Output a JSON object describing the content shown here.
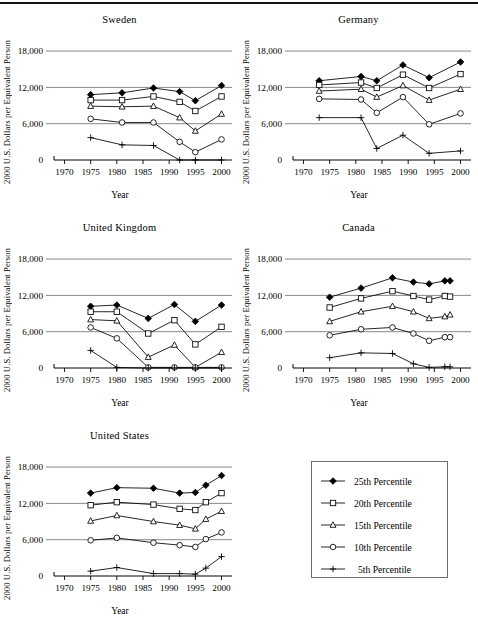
{
  "figure": {
    "axis_label_y": "2000 U.S. Dollars per Equivalent Person",
    "axis_label_x": "Year",
    "y_ticks": [
      "0",
      "6,000",
      "12,000",
      "18,000"
    ],
    "x_ticks": [
      "1970",
      "1975",
      "1980",
      "1985",
      "1990",
      "1995",
      "2000"
    ]
  },
  "legend": {
    "items": [
      {
        "label": "25th Percentile",
        "marker": "filled-diamond"
      },
      {
        "label": "20th Percentile",
        "marker": "open-square"
      },
      {
        "label": "15th Percentile",
        "marker": "open-triangle"
      },
      {
        "label": "10th Percentile",
        "marker": "open-circle"
      },
      {
        "label": "5th Percentile",
        "marker": "plus"
      }
    ]
  },
  "chart_data": [
    {
      "type": "line",
      "title": "Sweden",
      "xlabel": "Year",
      "ylabel": "2000 U.S. Dollars per Equivalent Person",
      "xlim": [
        1968,
        2002
      ],
      "ylim": [
        0,
        19500
      ],
      "yticks": [
        0,
        6000,
        12000,
        18000
      ],
      "xticks": [
        1970,
        1975,
        1980,
        1985,
        1990,
        1995,
        2000
      ],
      "grid": "horizontal",
      "x": [
        1975,
        1981,
        1987,
        1992,
        1995,
        2000
      ],
      "series": [
        {
          "name": "25th Percentile",
          "marker": "filled-diamond",
          "values": [
            10800,
            11100,
            11900,
            11300,
            9800,
            12300
          ]
        },
        {
          "name": "20th Percentile",
          "marker": "open-square",
          "values": [
            9900,
            9900,
            10500,
            9600,
            8100,
            10500
          ]
        },
        {
          "name": "15th Percentile",
          "marker": "open-triangle",
          "values": [
            8900,
            8800,
            8900,
            7000,
            4800,
            7600
          ]
        },
        {
          "name": "10th Percentile",
          "marker": "open-circle",
          "values": [
            6800,
            6200,
            6200,
            3000,
            1300,
            3400
          ]
        },
        {
          "name": "5th Percentile",
          "marker": "plus",
          "values": [
            3700,
            2500,
            2400,
            0,
            0,
            0
          ]
        }
      ]
    },
    {
      "type": "line",
      "title": "Germany",
      "xlabel": "Year",
      "ylabel": "2000 U.S. Dollars per Equivalent Person",
      "xlim": [
        1968,
        2002
      ],
      "ylim": [
        0,
        19500
      ],
      "yticks": [
        0,
        6000,
        12000,
        18000
      ],
      "xticks": [
        1970,
        1975,
        1980,
        1985,
        1990,
        1995,
        2000
      ],
      "grid": "horizontal",
      "x": [
        1973,
        1981,
        1984,
        1989,
        1994,
        2000
      ],
      "series": [
        {
          "name": "25th Percentile",
          "marker": "filled-diamond",
          "values": [
            13100,
            13800,
            13100,
            15700,
            13600,
            16200
          ]
        },
        {
          "name": "20th Percentile",
          "marker": "open-square",
          "values": [
            12400,
            12800,
            11900,
            14100,
            11900,
            14200
          ]
        },
        {
          "name": "15th Percentile",
          "marker": "open-triangle",
          "values": [
            11400,
            11700,
            10400,
            12300,
            9900,
            11700
          ]
        },
        {
          "name": "10th Percentile",
          "marker": "open-circle",
          "values": [
            10100,
            10000,
            7800,
            10400,
            5900,
            7700
          ]
        },
        {
          "name": "5th Percentile",
          "marker": "plus",
          "values": [
            7000,
            7000,
            1900,
            4100,
            1100,
            1500
          ]
        }
      ]
    },
    {
      "type": "line",
      "title": "United Kingdom",
      "xlabel": "Year",
      "ylabel": "2000 U.S. Dollars per Equivalent Person",
      "xlim": [
        1968,
        2002
      ],
      "ylim": [
        0,
        19500
      ],
      "yticks": [
        0,
        6000,
        12000,
        18000
      ],
      "xticks": [
        1970,
        1975,
        1980,
        1985,
        1990,
        1995,
        2000
      ],
      "grid": "horizontal",
      "x": [
        1975,
        1980,
        1986,
        1991,
        1995,
        2000
      ],
      "series": [
        {
          "name": "25th Percentile",
          "marker": "filled-diamond",
          "values": [
            10200,
            10400,
            8200,
            10500,
            7700,
            10400
          ]
        },
        {
          "name": "20th Percentile",
          "marker": "open-square",
          "values": [
            9300,
            9300,
            5700,
            7900,
            3900,
            6800
          ]
        },
        {
          "name": "15th Percentile",
          "marker": "open-triangle",
          "values": [
            8000,
            7800,
            1800,
            3800,
            100,
            2600
          ]
        },
        {
          "name": "10th Percentile",
          "marker": "open-circle",
          "values": [
            6700,
            4900,
            100,
            100,
            100,
            100
          ]
        },
        {
          "name": "5th Percentile",
          "marker": "plus",
          "values": [
            2900,
            100,
            0,
            0,
            0,
            0
          ]
        }
      ]
    },
    {
      "type": "line",
      "title": "Canada",
      "xlabel": "Year",
      "ylabel": "2000 U.S. Dollars per Equivalent Person",
      "xlim": [
        1968,
        2002
      ],
      "ylim": [
        0,
        19500
      ],
      "yticks": [
        0,
        6000,
        12000,
        18000
      ],
      "xticks": [
        1970,
        1975,
        1980,
        1985,
        1990,
        1995,
        2000
      ],
      "grid": "horizontal",
      "x": [
        1975,
        1981,
        1987,
        1991,
        1994,
        1997,
        1998
      ],
      "series": [
        {
          "name": "25th Percentile",
          "marker": "filled-diamond",
          "values": [
            11700,
            13200,
            14900,
            14200,
            13900,
            14400,
            14400
          ]
        },
        {
          "name": "20th Percentile",
          "marker": "open-square",
          "values": [
            10000,
            11500,
            12700,
            11900,
            11300,
            11900,
            11800
          ]
        },
        {
          "name": "15th Percentile",
          "marker": "open-triangle",
          "values": [
            7700,
            9300,
            10200,
            9300,
            8200,
            8500,
            8800
          ]
        },
        {
          "name": "10th Percentile",
          "marker": "open-circle",
          "values": [
            5400,
            6400,
            6700,
            5700,
            4500,
            5100,
            5100
          ]
        },
        {
          "name": "5th Percentile",
          "marker": "plus",
          "values": [
            1700,
            2500,
            2400,
            700,
            100,
            200,
            200
          ]
        }
      ]
    },
    {
      "type": "line",
      "title": "United States",
      "xlabel": "Year",
      "ylabel": "2000 U.S. Dollars per Equivalent Person",
      "xlim": [
        1968,
        2002
      ],
      "ylim": [
        0,
        19500
      ],
      "yticks": [
        0,
        6000,
        12000,
        18000
      ],
      "xticks": [
        1970,
        1975,
        1980,
        1985,
        1990,
        1995,
        2000
      ],
      "grid": "horizontal",
      "x": [
        1975,
        1980,
        1987,
        1992,
        1995,
        1997,
        2000
      ],
      "series": [
        {
          "name": "25th Percentile",
          "marker": "filled-diamond",
          "values": [
            13700,
            14600,
            14500,
            13700,
            13800,
            15000,
            16600
          ]
        },
        {
          "name": "20th Percentile",
          "marker": "open-square",
          "values": [
            11700,
            12200,
            11800,
            11100,
            10900,
            12200,
            13700
          ]
        },
        {
          "name": "15th Percentile",
          "marker": "open-triangle",
          "values": [
            9100,
            10000,
            9000,
            8400,
            7800,
            9400,
            10700
          ]
        },
        {
          "name": "10th Percentile",
          "marker": "open-circle",
          "values": [
            5900,
            6300,
            5500,
            5100,
            4800,
            6100,
            7200
          ]
        },
        {
          "name": "5th Percentile",
          "marker": "plus",
          "values": [
            800,
            1400,
            400,
            400,
            300,
            1300,
            3200
          ]
        }
      ]
    }
  ]
}
